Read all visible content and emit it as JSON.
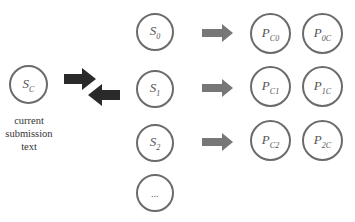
{
  "current": {
    "label": "S",
    "sub": "C",
    "caption": [
      "current",
      "submission",
      "text"
    ]
  },
  "submissions": [
    {
      "label": "S",
      "sub": "0"
    },
    {
      "label": "S",
      "sub": "1"
    },
    {
      "label": "S",
      "sub": "2"
    },
    {
      "label": "...",
      "sub": ""
    }
  ],
  "pairs": [
    {
      "left": {
        "label": "P",
        "sub": "C0"
      },
      "right": {
        "label": "P",
        "sub": "0C"
      }
    },
    {
      "left": {
        "label": "P",
        "sub": "C1"
      },
      "right": {
        "label": "P",
        "sub": "1C"
      }
    },
    {
      "left": {
        "label": "P",
        "sub": "C2"
      },
      "right": {
        "label": "P",
        "sub": "2C"
      }
    }
  ],
  "colors": {
    "circle_border": "#6b6b6b",
    "compare_arrow": "#2a2a2a",
    "flow_arrow": "#777777"
  }
}
